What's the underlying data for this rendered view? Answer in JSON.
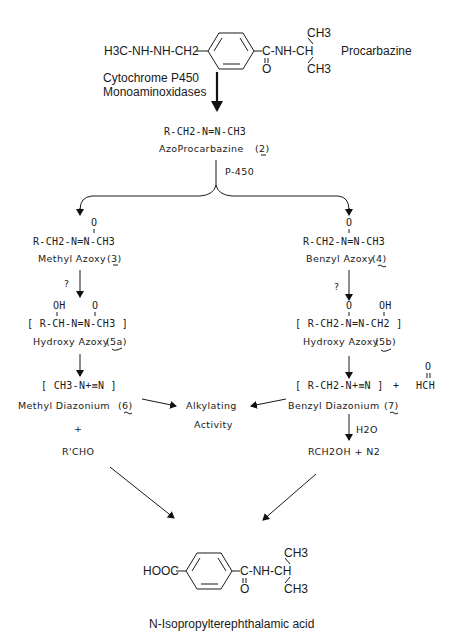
{
  "diagram": {
    "nodes": {
      "procarbazine": {
        "left_group": "H3C-NH-NH-CH2",
        "right_group": "C-NH-CH",
        "carbonyl_o": "O",
        "ch3_top": "CH3",
        "ch3_bottom": "CH3",
        "name": "Procarbazine"
      },
      "enzymes": {
        "line1": "Cytochrome P450",
        "line2": "Monoaminoxidases"
      },
      "azo_procarbazine": {
        "formula": "R-CH2-N=N-CH3",
        "name": "AzoProcarbazine",
        "number": "(2)"
      },
      "p450_label": "P-450",
      "methyl_azoxy": {
        "o_label": "O",
        "formula": "R-CH2-N=N-CH3",
        "name": "Methyl Azoxy",
        "number": "(3)"
      },
      "benzyl_azoxy": {
        "o_label": "O",
        "formula": "R-CH2-N=N-CH3",
        "name": "Benzyl Azoxy",
        "number": "(4)"
      },
      "question_left": "?",
      "question_right": "?",
      "hydroxy_azoxy_a": {
        "oh_label": "OH",
        "o_label": "O",
        "formula": "[ R-CH-N=N-CH3 ]",
        "name": "Hydroxy Azoxy",
        "number": "(5a)"
      },
      "hydroxy_azoxy_b": {
        "o_label": "O",
        "oh_label": "OH",
        "formula": "[ R-CH2-N=N-CH2 ]",
        "name": "Hydroxy Azoxy",
        "number": "(5b)"
      },
      "methyl_diazonium": {
        "formula": "[ CH3-N+≡N ]",
        "name": "Methyl Diazonium",
        "number": "(6)"
      },
      "benzyl_diazonium": {
        "formula": "[ R-CH2-N+≡N ]",
        "plus": "+",
        "formaldehyde_o": "O",
        "formaldehyde": "HCH",
        "name": "Benzyl Diazonium",
        "number": "(7)"
      },
      "alkylating": {
        "line1": "Alkylating",
        "line2": "Activity"
      },
      "plus_left": "+",
      "rcho": "R'CHO",
      "water": "H2O",
      "rch2oh": "RCH2OH + N2",
      "final_product": {
        "left_group": "HOOC",
        "right_group": "C-NH-CH",
        "carbonyl_o": "O",
        "ch3_top": "CH3",
        "ch3_bottom": "CH3",
        "name": "N-Isopropylterephthalamic acid"
      }
    },
    "colors": {
      "ink": "#1a1a1a",
      "background": "#ffffff"
    }
  }
}
